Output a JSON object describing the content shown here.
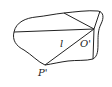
{
  "diagram": {
    "stroke_color": "#222222",
    "background": "#ffffff",
    "labels": {
      "line": "l",
      "center": "O'",
      "point": "P'"
    }
  }
}
